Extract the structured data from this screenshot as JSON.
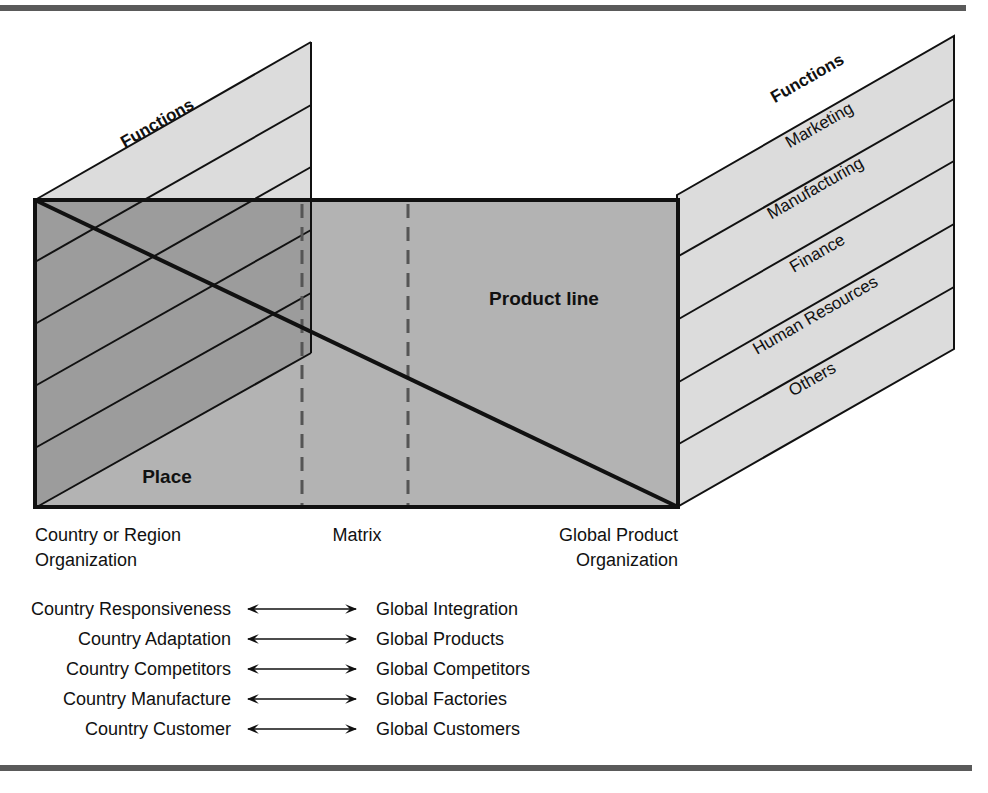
{
  "diagram": {
    "left_panel": {
      "title": "Functions"
    },
    "right_panel": {
      "title": "Functions",
      "rows": [
        "Marketing",
        "Manufacturing",
        "Finance",
        "Human Resources",
        "Others"
      ]
    },
    "main_panel": {
      "upper_region_label": "Product line",
      "lower_region_label": "Place"
    },
    "axis_labels": {
      "left_line1": "Country or Region",
      "left_line2": "Organization",
      "middle": "Matrix",
      "right_line1": "Global Product",
      "right_line2": "Organization"
    },
    "tradeoffs": [
      {
        "country": "Country Responsiveness",
        "global": "Global Integration"
      },
      {
        "country": "Country Adaptation",
        "global": "Global Products"
      },
      {
        "country": "Country Competitors",
        "global": "Global Competitors"
      },
      {
        "country": "Country Manufacture",
        "global": "Global Factories"
      },
      {
        "country": "Country Customer",
        "global": "Global Customers"
      }
    ],
    "colors": {
      "light_panel": "#dcdcdc",
      "main_panel": "#b3b3b3",
      "overlap": "#9c9c9c",
      "rule": "#555555",
      "dash": "#555555",
      "stroke": "#111111"
    }
  }
}
